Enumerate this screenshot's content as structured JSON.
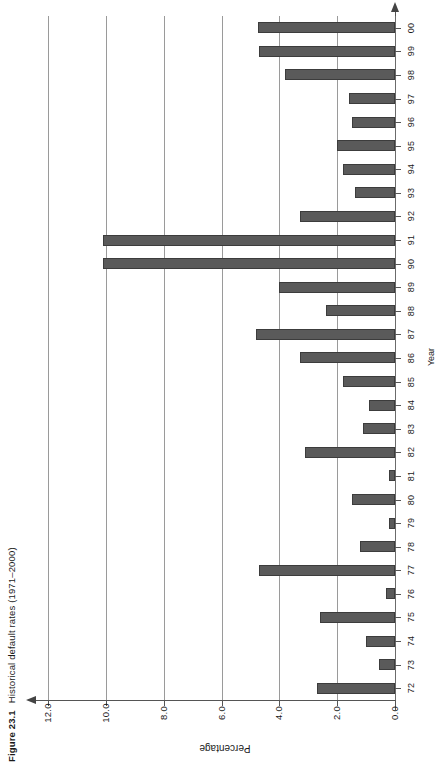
{
  "figure": {
    "number": "Figure 23.1",
    "caption": "Historical default rates (1971–2000)"
  },
  "chart_data": {
    "type": "bar",
    "orientation": "horizontal",
    "title": "Historical default rates (1971–2000)",
    "xlabel": "Percentage",
    "ylabel": "Year",
    "categories": [
      "72",
      "73",
      "74",
      "75",
      "76",
      "77",
      "78",
      "79",
      "80",
      "81",
      "82",
      "83",
      "84",
      "85",
      "86",
      "87",
      "88",
      "89",
      "90",
      "91",
      "92",
      "93",
      "94",
      "95",
      "96",
      "97",
      "98",
      "99",
      "00"
    ],
    "values": [
      2.7,
      0.55,
      1.0,
      2.6,
      0.3,
      4.7,
      1.2,
      0.2,
      1.5,
      0.2,
      3.1,
      1.1,
      0.9,
      1.8,
      3.3,
      4.8,
      2.4,
      4.0,
      10.1,
      10.1,
      3.3,
      1.4,
      1.8,
      2.0,
      1.5,
      1.6,
      3.8,
      4.7,
      4.75
    ],
    "value_axis_ticks": [
      "0.0",
      "2.0",
      "4.0",
      "6.0",
      "8.0",
      "10.0",
      "12.0"
    ],
    "value_axis_tick_values": [
      0.0,
      2.0,
      4.0,
      6.0,
      8.0,
      10.0,
      12.0
    ],
    "xlim": [
      0.0,
      12.0
    ],
    "grid": true,
    "legend": "none",
    "bar_color": "#5a5a5a",
    "grid_color": "#9a9a9a",
    "axis_color": "#555555"
  }
}
